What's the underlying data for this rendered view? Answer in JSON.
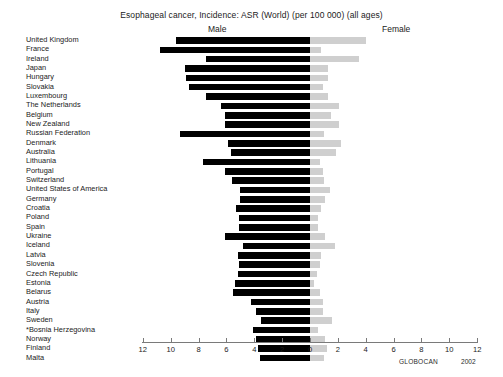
{
  "chart_data": {
    "type": "bar",
    "orientation": "horizontal",
    "subtype": "population-pyramid",
    "title": "Esophageal cancer, Incidence: ASR (World) (per 100 000) (all ages)",
    "xlabel": "",
    "ylabel": "",
    "grid": false,
    "legend_position": "top",
    "axis": {
      "ticks": [
        12,
        10,
        8,
        6,
        4,
        2,
        0,
        2,
        4,
        6,
        8,
        10,
        12
      ],
      "left_max": 12,
      "right_max": 12,
      "center_value": 0
    },
    "legend": [
      {
        "name": "Male",
        "color": "#000000"
      },
      {
        "name": "Female",
        "color": "#cfcfcf"
      }
    ],
    "categories": [
      "United Kingdom",
      "France",
      "Ireland",
      "Japan",
      "Hungary",
      "Slovakia",
      "Luxembourg",
      "The Netherlands",
      "Belgium",
      "New Zealand",
      "Russian Federation",
      "Denmark",
      "Australia",
      "Lithuania",
      "Portugal",
      "Switzerland",
      "United States of America",
      "Germany",
      "Croatia",
      "Poland",
      "Spain",
      "Ukraine",
      "Iceland",
      "Latvia",
      "Slovenia",
      "Czech Republic",
      "Estonia",
      "Belarus",
      "Austria",
      "Italy",
      "Sweden",
      "*Bosnia Herzegovina",
      "Norway",
      "Finland",
      "Malta"
    ],
    "series": [
      {
        "name": "Male",
        "color": "#000000",
        "values": [
          9.6,
          10.8,
          7.5,
          9.0,
          8.9,
          8.7,
          7.5,
          6.4,
          6.1,
          6.1,
          9.3,
          5.9,
          5.7,
          7.7,
          6.1,
          5.6,
          5.0,
          5.0,
          5.3,
          5.1,
          5.1,
          6.1,
          4.8,
          5.2,
          5.1,
          5.2,
          5.4,
          5.5,
          4.2,
          3.9,
          3.5,
          4.1,
          3.9,
          3.7,
          3.6
        ]
      },
      {
        "name": "Female",
        "color": "#cfcfcf",
        "values": [
          4.0,
          0.8,
          3.5,
          1.3,
          1.3,
          0.9,
          1.3,
          2.1,
          1.5,
          2.1,
          1.0,
          2.2,
          1.9,
          0.7,
          0.9,
          1.0,
          1.4,
          1.1,
          0.8,
          0.6,
          0.6,
          1.1,
          1.8,
          0.8,
          0.7,
          0.5,
          0.3,
          0.7,
          0.9,
          0.9,
          1.6,
          0.6,
          1.1,
          1.2,
          1.0
        ]
      }
    ],
    "credit": "GLOBOCAN",
    "credit_year": "2002"
  }
}
